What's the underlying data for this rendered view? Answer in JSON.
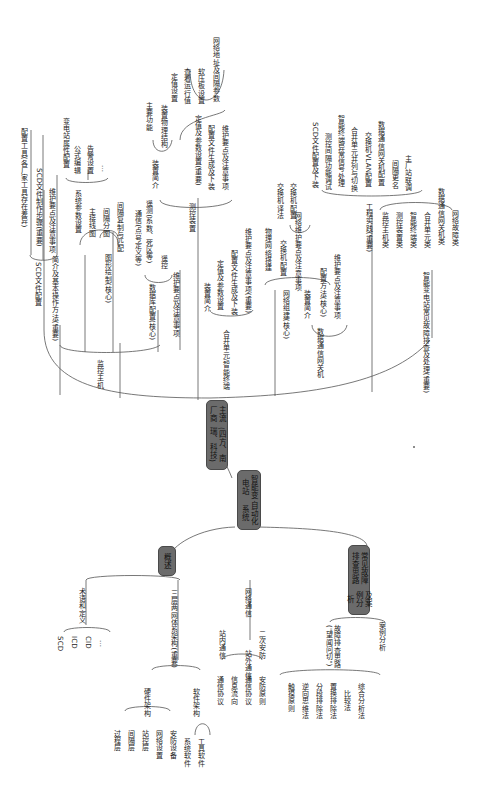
{
  "diagram": {
    "type": "mind-map",
    "orientation": "rotated-90",
    "root": {
      "line1": "智能变电站",
      "line2": "自动化系统"
    },
    "main_branches": [
      {
        "id": "vendor",
        "line1": "主流厂商",
        "line2": "(四方、南瑞、科技)"
      },
      {
        "id": "overview",
        "label": "概述"
      },
      {
        "id": "fault",
        "line1": "常见故障排查思路",
        "line2": "及案例分析"
      }
    ],
    "vendor_branch": {
      "monitor_host": {
        "label": "监控主机",
        "children": {
          "scd_config": {
            "label": "SCD文件配置",
            "children": [
              "配置工具(各厂家工具存在差异)",
              "SCD文件制作步骤(重要)",
              "维护要点及注意事项"
            ]
          },
          "intro": "简介及基本操作方法(重要)",
          "graphics": {
            "label": "图形绘制(核心)",
            "sys_param": {
              "label": "系统参数设置",
              "children": [
                "变电站属性配置",
                "公式编辑",
                "告警设置",
                "…"
              ]
            },
            "children": [
              "主接线图",
              "间隔分图",
              "间隔复制与匹配"
            ]
          },
          "comm": {
            "label": "通信(点号定义等)",
            "children": [
              "遥测(系数、死区等)",
              "遥控"
            ]
          },
          "database": "数据库配置(核心)",
          "maintenance": "维护要点及注意事项"
        }
      },
      "measure_control": {
        "label": "测控装置",
        "device_intro": {
          "label": "装置简介",
          "children": [
            "主要功能",
            "装置物理结构"
          ]
        },
        "setting": {
          "label": "定值及参数设置(重要)",
          "children": [
            "定值设置",
            "查看运行值",
            "软压板设置",
            "网络地址及间隔参数"
          ]
        },
        "children": [
          "配置文件生成及下装",
          "维护要点及注意事项"
        ]
      },
      "merging_unit": {
        "label": "合并单元/智能终端",
        "children": [
          "装置简介",
          "定值及参数设置",
          "配置文件生成及下装",
          "维护要点及注意事项(重要)"
        ]
      },
      "network": {
        "label": "网络组建(核心)",
        "children": [
          "物理网络搭建",
          "交换机配置",
          "网络维护要点及注意事项"
        ],
        "switch_children": [
          "交换机译法",
          "交换机配置"
        ]
      },
      "gateway": {
        "label": "数据通信网关机",
        "children": [
          "装置简介",
          "配置方法(核心)",
          "维护要点及注意事项"
        ]
      },
      "engineering": {
        "label": "工程实践(重要)",
        "upper": [
          "SCD文件配置及下装",
          "测控间隔功能调试",
          "智能终端异常信号处理",
          "合并单元并列与切换",
          "交换机VLAN配置",
          "数据通信网关机配置",
          "间隔更名",
          "主厂站联调"
        ],
        "lower": [
          "监控主机类",
          "测控装置类",
          "智能终端类",
          "合并单元类",
          "数据通信网关机类",
          "网络故障类"
        ]
      },
      "troubleshoot": "智能变电站常见故障排查及处理(重要)"
    },
    "overview_branch": {
      "terms": {
        "label": "术语和定义",
        "children": [
          "SCD",
          "ICD",
          "CID",
          "…"
        ]
      },
      "three_layer": {
        "label": "三层两网体系架构(重要)",
        "hardware": {
          "label": "硬件架构",
          "children": [
            "过程层",
            "间隔层",
            "站控层",
            "网络设置",
            "安防设备"
          ]
        },
        "software": {
          "label": "软件架构",
          "children": [
            "系统软件",
            "工具软件"
          ]
        }
      },
      "network_comm": {
        "label": "网络通信",
        "in_station": {
          "label": "站内通信",
          "children": [
            "通信协议",
            "信息流向"
          ]
        },
        "out_station": {
          "label": "站外通信",
          "children": [
            "通信协议",
            "安防原则"
          ]
        },
        "secondary_security": "二次安防"
      }
    },
    "fault_branch": {
      "approach": {
        "label": "故障排查思路(\"望闻问切\")",
        "children": [
          "触摸原则",
          "逆向思维法",
          "分段排除法",
          "置换排除法",
          "比较法",
          "综合分析法"
        ]
      },
      "case": "案例分析"
    }
  }
}
